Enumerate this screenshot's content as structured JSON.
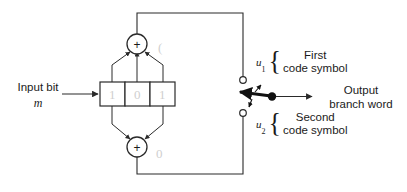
{
  "figure": {
    "background_color": "#ffffff",
    "line_color": "#2a2a2a",
    "ghost_color": "#cfcfcf"
  },
  "input": {
    "label": "Input bit",
    "symbol": "m",
    "arrow_icon": "right-arrow-icon"
  },
  "shift_register": {
    "name": "shift-register",
    "stage_count": 3,
    "stages": [
      {
        "index": 1,
        "value": "1"
      },
      {
        "index": 2,
        "value": "0"
      },
      {
        "index": 3,
        "value": "1"
      }
    ]
  },
  "adders": [
    {
      "id": "upper",
      "name": "upper-modulo-2-adder",
      "glyph": "+",
      "operation": "modulo-2 sum",
      "tap_count": 3,
      "ghost_mark": "("
    },
    {
      "id": "lower",
      "name": "lower-modulo-2-adder",
      "glyph": "+",
      "operation": "modulo-2 sum",
      "tap_count": 2,
      "ghost_mark": "0"
    }
  ],
  "switch": {
    "name": "output-commutator-switch",
    "pivot_icon": "filled-dot-icon",
    "arm_icon": "switch-arm-icon",
    "rotation_icons": [
      "rotate-up-arrow-icon",
      "rotate-down-arrow-icon"
    ],
    "contacts": [
      {
        "id": "upper",
        "name": "upper-switch-contact",
        "icon": "open-circle-icon"
      },
      {
        "id": "lower",
        "name": "lower-switch-contact",
        "icon": "open-circle-icon"
      }
    ]
  },
  "outputs": [
    {
      "id": "u1",
      "symbol": "u",
      "subscript": "1",
      "brace": "{",
      "line1": "First",
      "line2": "code symbol"
    },
    {
      "id": "u2",
      "symbol": "u",
      "subscript": "2",
      "brace": "{",
      "line1": "Second",
      "line2": "code symbol"
    }
  ],
  "output_branch": {
    "name": "output-branch-word",
    "line1": "Output",
    "line2": "branch word",
    "arrow_icon": "right-arrow-icon"
  }
}
